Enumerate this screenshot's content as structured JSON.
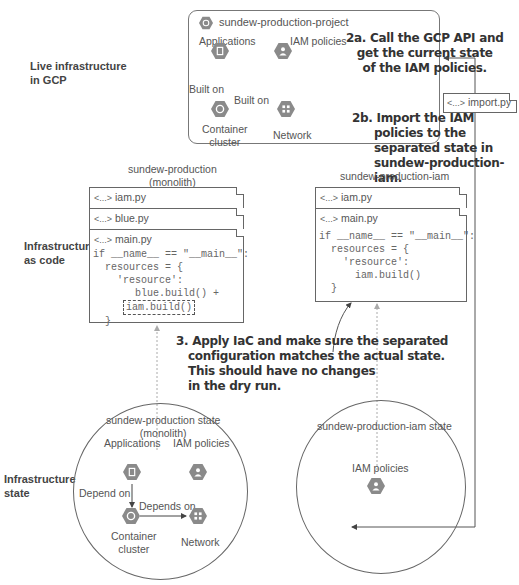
{
  "row_labels": {
    "live": [
      "Live infrastructure",
      "in GCP"
    ],
    "iac": [
      "Infrastructure",
      "as code"
    ],
    "state": [
      "Infrastructure",
      "state"
    ]
  },
  "gcp_project": {
    "title": "sundew-production-project",
    "nodes": {
      "applications": "Applications",
      "iam_policies": "IAM policies",
      "container_cluster": [
        "Container",
        "cluster"
      ],
      "network": "Network"
    },
    "edges": {
      "apps_to_cluster": "Built on",
      "cluster_to_network": "Built on"
    }
  },
  "notes": {
    "step_2a": [
      "2a. Call the GCP API and",
      "get the current state",
      "of the IAM policies."
    ],
    "step_2b": [
      "2b. Import the IAM",
      "policies to the",
      "separated state in",
      "sundew-production-iam."
    ],
    "step_3": [
      "3. Apply IaC and make sure the separated",
      "configuration matches the actual state.",
      "This should have no changes",
      "in the dry run."
    ]
  },
  "import_file": {
    "icon": "<...>",
    "name": "import.py"
  },
  "monolith_repo": {
    "title": [
      "sundew-production",
      "(monolith)"
    ],
    "files": [
      {
        "icon": "<...>",
        "name": "iam.py"
      },
      {
        "icon": "<...>",
        "name": "blue.py"
      },
      {
        "icon": "<...>",
        "name": "main.py"
      }
    ],
    "code": [
      "if __name__ == \"__main__\":",
      "  resources = {",
      "    'resource':",
      "       blue.build() +",
      "iam.build()",
      "  }"
    ]
  },
  "iam_repo": {
    "title": "sundew-production-iam",
    "files": [
      {
        "icon": "<...>",
        "name": "iam.py"
      },
      {
        "icon": "<...>",
        "name": "main.py"
      }
    ],
    "code": [
      "if __name__ == \"__main__\":",
      "  resources = {",
      "    'resource':",
      "      iam.build()",
      "  }"
    ]
  },
  "monolith_state": {
    "title": [
      "sundew-production state",
      "(monolith)"
    ],
    "nodes": {
      "applications": "Applications",
      "iam_policies": "IAM policies",
      "container_cluster": [
        "Container",
        "cluster"
      ],
      "network": "Network"
    },
    "edges": {
      "apps_to_cluster": "Depend on",
      "cluster_to_network": "Depends on"
    }
  },
  "iam_state": {
    "title": "sundew-production-iam state",
    "nodes": {
      "iam_policies": "IAM policies"
    }
  },
  "colors": {
    "hex_icon": "#8a8a8a",
    "line": "#555555",
    "dotted": "#aaaaaa"
  }
}
